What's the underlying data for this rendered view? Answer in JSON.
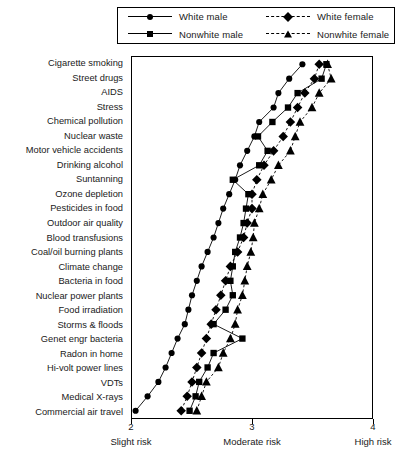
{
  "legend": {
    "items": [
      {
        "label": "White male",
        "marker": "circle",
        "line": "solid"
      },
      {
        "label": "White female",
        "marker": "diamond",
        "line": "dashed"
      },
      {
        "label": "Nonwhite male",
        "marker": "square",
        "line": "solid"
      },
      {
        "label": "Nonwhite female",
        "marker": "triangle",
        "line": "dashed"
      }
    ]
  },
  "chart_data": {
    "type": "line",
    "title": "",
    "xlabel": "",
    "ylabel": "",
    "xlim": [
      2,
      4
    ],
    "grid": false,
    "legend_position": "top",
    "orientation": "horizontal-dotplot",
    "xticks": [
      {
        "value": 2,
        "label": "2",
        "caption": "Slight risk"
      },
      {
        "value": 3,
        "label": "3",
        "caption": "Moderate risk"
      },
      {
        "value": 4,
        "label": "4",
        "caption": "High risk"
      }
    ],
    "categories": [
      "Cigarette smoking",
      "Street drugs",
      "AIDS",
      "Stress",
      "Chemical pollution",
      "Nuclear waste",
      "Motor vehicle accidents",
      "Drinking alcohol",
      "Suntanning",
      "Ozone depletion",
      "Pesticides in food",
      "Outdoor air quality",
      "Blood transfusions",
      "Coal/oil burning plants",
      "Climate change",
      "Bacteria in food",
      "Nuclear power plants",
      "Food irradiation",
      "Storms & floods",
      "Genet engr bacteria",
      "Radon in home",
      "Hi-volt power lines",
      "VDTs",
      "Medical X-rays",
      "Commercial air travel"
    ],
    "series": [
      {
        "name": "White male",
        "marker": "circle",
        "line": "solid",
        "values": [
          3.42,
          3.31,
          3.22,
          3.18,
          3.06,
          3.02,
          2.96,
          2.9,
          2.86,
          2.81,
          2.76,
          2.72,
          2.68,
          2.63,
          2.58,
          2.54,
          2.5,
          2.47,
          2.44,
          2.38,
          2.33,
          2.28,
          2.22,
          2.13,
          2.03
        ]
      },
      {
        "name": "Nonwhite male",
        "marker": "square",
        "line": "solid",
        "values": [
          3.62,
          3.58,
          3.38,
          3.3,
          3.17,
          3.05,
          3.13,
          3.06,
          2.84,
          2.97,
          2.95,
          2.93,
          2.9,
          2.86,
          2.84,
          2.82,
          2.84,
          2.78,
          2.68,
          2.92,
          2.68,
          2.63,
          2.56,
          2.53,
          2.48
        ]
      },
      {
        "name": "White female",
        "marker": "diamond",
        "line": "dashed",
        "values": [
          3.56,
          3.52,
          3.44,
          3.38,
          3.32,
          3.26,
          3.18,
          3.1,
          3.04,
          3.0,
          3.0,
          2.96,
          2.93,
          2.88,
          2.82,
          2.78,
          2.74,
          2.7,
          2.66,
          2.62,
          2.58,
          2.54,
          2.5,
          2.46,
          2.41
        ]
      },
      {
        "name": "Nonwhite female",
        "marker": "triangle",
        "line": "dashed",
        "values": [
          3.63,
          3.66,
          3.56,
          3.5,
          3.4,
          3.36,
          3.32,
          3.22,
          3.16,
          3.09,
          3.06,
          3.02,
          3.01,
          2.99,
          2.96,
          2.94,
          2.92,
          2.88,
          2.86,
          2.82,
          2.76,
          2.72,
          2.62,
          2.58,
          2.54
        ]
      }
    ]
  }
}
